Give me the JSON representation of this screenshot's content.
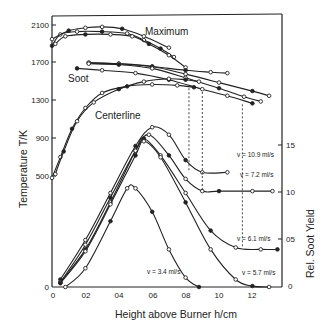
{
  "chart_data": {
    "type": "line",
    "title": "",
    "xlabel": "Height above Burner h/cm",
    "ylabel_left": "Temperature T/K",
    "ylabel_right": "Rel. Soot Yield",
    "xlim": [
      0,
      1.35
    ],
    "x_ticks": [
      "0",
      "0.2",
      "0.4",
      "0.6",
      "0.8",
      "1.0",
      "1.2"
    ],
    "y_left_ticks": [
      "0",
      "500",
      "900",
      "1300",
      "1700",
      "2100"
    ],
    "y_right_ticks": [
      "0",
      "0.5",
      "1.0",
      "1.5"
    ],
    "grid": false,
    "annotations": [
      "Maximum",
      "Soot",
      "Centerline",
      "v = 10.9 ml/s",
      "v = 7.2 ml/s",
      "v = 6.1 ml/s",
      "v = 5.7 ml/s",
      "v = 3.4 ml/s"
    ],
    "temperature_series": [
      {
        "name": "Maximum 1",
        "x": [
          0.0,
          0.05,
          0.15,
          0.3,
          0.45,
          0.55,
          0.65,
          0.73
        ],
        "values": [
          1880,
          2000,
          2030,
          2030,
          2010,
          1940,
          1850,
          1760
        ]
      },
      {
        "name": "Maximum 2",
        "x": [
          0.02,
          0.08,
          0.2,
          0.35,
          0.48,
          0.58,
          0.7,
          0.8
        ],
        "values": [
          1900,
          1980,
          2000,
          2000,
          1980,
          1900,
          1780,
          1650
        ]
      },
      {
        "name": "Maximum 3",
        "x": [
          0.0,
          0.1,
          0.2,
          0.3,
          0.42,
          0.55,
          0.7
        ],
        "values": [
          1950,
          2040,
          2070,
          2080,
          2060,
          1980,
          1860
        ]
      },
      {
        "name": "Soot 1",
        "x": [
          0.22,
          0.4,
          0.6,
          0.8,
          0.95,
          1.05
        ],
        "values": [
          1700,
          1690,
          1660,
          1620,
          1600,
          1590
        ]
      },
      {
        "name": "Soot 2",
        "x": [
          0.22,
          0.4,
          0.6,
          0.8,
          1.0,
          1.2,
          1.3
        ],
        "values": [
          1700,
          1690,
          1660,
          1580,
          1490,
          1400,
          1350
        ]
      },
      {
        "name": "Soot 3",
        "x": [
          0.22,
          0.4,
          0.6,
          0.8,
          1.0,
          1.15,
          1.25
        ],
        "values": [
          1690,
          1680,
          1640,
          1540,
          1430,
          1340,
          1290
        ]
      },
      {
        "name": "Soot 4",
        "x": [
          0.15,
          0.3,
          0.5,
          0.7,
          0.9,
          1.05,
          1.2
        ],
        "values": [
          1640,
          1620,
          1590,
          1520,
          1420,
          1350,
          1270
        ]
      },
      {
        "name": "Centerline 1",
        "x": [
          0.0,
          0.05,
          0.12,
          0.2,
          0.3,
          0.45,
          0.6,
          0.75,
          0.85
        ],
        "values": [
          480,
          700,
          1000,
          1220,
          1380,
          1450,
          1470,
          1460,
          1440
        ]
      },
      {
        "name": "Centerline 2",
        "x": [
          0.02,
          0.07,
          0.15,
          0.25,
          0.4,
          0.55,
          0.7,
          0.8,
          0.88
        ],
        "values": [
          520,
          760,
          1080,
          1280,
          1420,
          1500,
          1530,
          1520,
          1500
        ]
      }
    ],
    "soot_series": [
      {
        "name": "v = 10.9 ml/s",
        "x": [
          0.05,
          0.2,
          0.35,
          0.5,
          0.6,
          0.7,
          0.8,
          0.9,
          1.05
        ],
        "values": [
          0.08,
          0.5,
          1.0,
          1.5,
          1.7,
          1.62,
          1.35,
          1.22,
          1.22
        ]
      },
      {
        "name": "v = 7.2 ml/s",
        "x": [
          0.05,
          0.2,
          0.35,
          0.5,
          0.58,
          0.7,
          0.8,
          0.9,
          1.0,
          1.2,
          1.32
        ],
        "values": [
          0.05,
          0.45,
          0.95,
          1.45,
          1.62,
          1.4,
          1.15,
          1.02,
          1.02,
          1.02,
          1.02
        ]
      },
      {
        "name": "v = 6.1 ml/s",
        "x": [
          0.05,
          0.2,
          0.35,
          0.5,
          0.55,
          0.65,
          0.8,
          0.95,
          1.1,
          1.25,
          1.35
        ],
        "values": [
          0.05,
          0.4,
          0.9,
          1.45,
          1.58,
          1.4,
          1.0,
          0.6,
          0.42,
          0.4,
          0.4
        ]
      },
      {
        "name": "v = 5.7 ml/s",
        "x": [
          0.05,
          0.2,
          0.35,
          0.5,
          0.55,
          0.65,
          0.8,
          0.95,
          1.1,
          1.2,
          1.3
        ],
        "values": [
          0.04,
          0.38,
          0.88,
          1.4,
          1.55,
          1.38,
          0.9,
          0.4,
          0.08,
          0.01,
          0.0
        ]
      },
      {
        "name": "v = 3.4 ml/s",
        "x": [
          0.08,
          0.2,
          0.35,
          0.45,
          0.5,
          0.6,
          0.7,
          0.8,
          0.88
        ],
        "values": [
          0.0,
          0.2,
          0.7,
          1.05,
          1.05,
          0.8,
          0.4,
          0.1,
          0.0
        ]
      }
    ],
    "dashed_markers": [
      {
        "x": 0.82,
        "from_T": 1430,
        "to_soot": 1.22
      },
      {
        "x": 0.9,
        "from_T": 1390,
        "to_soot": 1.02
      },
      {
        "x": 1.14,
        "from_T": 1260,
        "to_soot": 0.42
      }
    ]
  },
  "labels": {
    "maximum": "Maximum",
    "soot": "Soot",
    "centerline": "Centerline",
    "v109": "v = 10.9 ml/s",
    "v72": "v = 7.2 ml/s",
    "v61": "v = 6.1 ml/s",
    "v57": "v = 5.7 ml/s",
    "v34": "v = 3.4 ml/s",
    "xlabel": "Height above Burner h/cm",
    "ylabel_left": "Temperature T/K",
    "ylabel_right": "Rel. Soot Yield"
  },
  "ticks": {
    "x": [
      "0",
      "02",
      "04",
      "06",
      "08",
      "10",
      "12"
    ],
    "yl": [
      "2100",
      "1700",
      "1300",
      "900",
      "500",
      "0"
    ],
    "yr": [
      "15",
      "10",
      "05",
      "0"
    ]
  }
}
